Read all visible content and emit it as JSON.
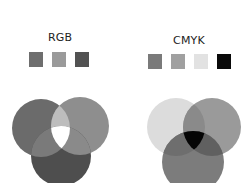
{
  "rgb": {
    "title": "RGB",
    "swatches": [
      {
        "name": "red",
        "color": "#6e6e6e"
      },
      {
        "name": "green",
        "color": "#9a9a9a"
      },
      {
        "name": "blue",
        "color": "#525252"
      }
    ],
    "venn": {
      "circle_colors": [
        "#6b6b6b",
        "#8e8e8e",
        "#4e4e4e"
      ],
      "pair_overlaps": [
        "#bdbdbd",
        "#8a8a8a",
        "#7a7a7a"
      ],
      "center": "#ffffff"
    }
  },
  "cmyk": {
    "title": "CMYK",
    "swatches": [
      {
        "name": "cyan",
        "color": "#7a7a7a"
      },
      {
        "name": "magenta",
        "color": "#a0a0a0"
      },
      {
        "name": "yellow",
        "color": "#e2e2e2"
      },
      {
        "name": "black",
        "color": "#0a0a0a"
      }
    ],
    "venn": {
      "circle_colors": [
        "#dcdcdc",
        "#9a9a9a",
        "#7c7c7c"
      ],
      "center": "#050505"
    }
  }
}
